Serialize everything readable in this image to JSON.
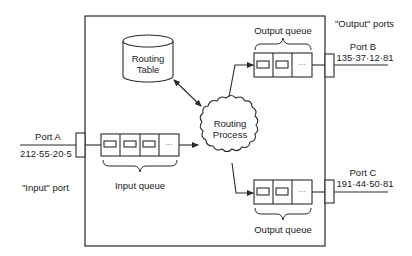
{
  "diagram": {
    "type": "router-architecture",
    "colors": {
      "stroke": "#2a2a2a",
      "background": "#ffffff"
    },
    "routing_table": {
      "label_line1": "Routing",
      "label_line2": "Table"
    },
    "routing_process": {
      "label_line1": "Routing",
      "label_line2": "Process"
    },
    "input_port": {
      "name": "Port A",
      "address": "212·55·20·5",
      "caption": "\"Input\" port"
    },
    "input_queue": {
      "label": "Input queue",
      "slots": [
        "packet",
        "packet",
        "packet",
        "..."
      ]
    },
    "output_ports_caption": "\"Output\" ports",
    "output_ports": [
      {
        "name": "Port B",
        "address": "135·37·12·81",
        "queue": {
          "label": "Output queue",
          "slots": [
            "packet",
            "packet",
            "..."
          ]
        }
      },
      {
        "name": "Port C",
        "address": "191·44·50·81",
        "queue": {
          "label": "Output queue",
          "slots": [
            "packet",
            "packet",
            "..."
          ]
        }
      }
    ],
    "ellipsis": "···"
  }
}
